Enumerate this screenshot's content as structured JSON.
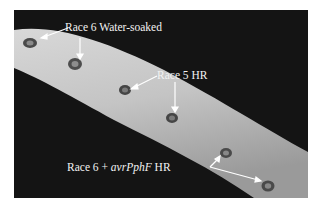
{
  "figure": {
    "background": "#141414",
    "stem_color": "#c9c9c9",
    "labels": {
      "water_soaked": "Race 6 Water-soaked",
      "race5_hr": "Race 5 HR",
      "race6_avr_prefix": "Race 6 + ",
      "race6_avr_gene": "avrPphF",
      "race6_avr_suffix": " HR"
    },
    "lesions": [
      {
        "type": "water-soaked",
        "x": 16,
        "y": 33
      },
      {
        "type": "water-soaked",
        "x": 61,
        "y": 54
      },
      {
        "type": "HR-race5",
        "x": 111,
        "y": 80
      },
      {
        "type": "HR-race5",
        "x": 158,
        "y": 108
      },
      {
        "type": "HR-avrPphF",
        "x": 212,
        "y": 143
      },
      {
        "type": "HR-avrPphF",
        "x": 254,
        "y": 176
      }
    ]
  }
}
